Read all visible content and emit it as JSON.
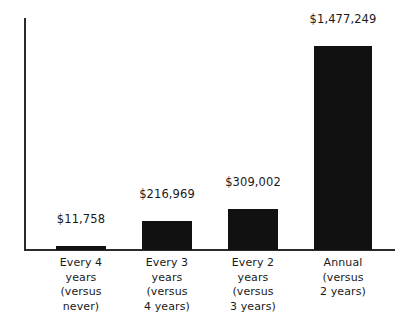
{
  "chart_data": {
    "type": "bar",
    "title": "",
    "subtitle": "",
    "xlabel": "",
    "ylabel": "",
    "grid": false,
    "legend": false,
    "axis_color": "#2b2b2b",
    "bar_color": "#111111",
    "background": "#ffffff",
    "ylim": [
      0,
      1680000
    ],
    "categories": [
      "Every 4 years (versus never)",
      "Every 3 years (versus 4 years)",
      "Every 2 years (versus 3 years)",
      "Annual (versus 2 years)"
    ],
    "category_lines": [
      [
        "Every 4 years",
        "(versus",
        "never)"
      ],
      [
        "Every 3 years",
        "(versus",
        "4 years)"
      ],
      [
        "Every 2 years",
        "(versus",
        "3 years)"
      ],
      [
        "Annual",
        "(versus",
        "2 years)"
      ]
    ],
    "values": [
      11758,
      216969,
      309002,
      1477249
    ],
    "value_labels": [
      "$11,758",
      "$216,969",
      "$309,002",
      "$1,477,249"
    ],
    "bars": [
      {
        "name": "every-4-years",
        "value": 11758,
        "value_label": "$11,758",
        "label_lines": [
          "Every 4 years",
          "(versus",
          "never)"
        ],
        "left_px": 30,
        "width_px": 50,
        "height_px": 4,
        "value_top_px": 194
      },
      {
        "name": "every-3-years",
        "value": 216969,
        "value_label": "$216,969",
        "label_lines": [
          "Every 3 years",
          "(versus",
          "4 years)"
        ],
        "left_px": 116,
        "width_px": 50,
        "height_px": 29,
        "value_top_px": 169
      },
      {
        "name": "every-2-years",
        "value": 309002,
        "value_label": "$309,002",
        "label_lines": [
          "Every 2 years",
          "(versus",
          "3 years)"
        ],
        "left_px": 202,
        "width_px": 50,
        "height_px": 41,
        "value_top_px": 157
      },
      {
        "name": "annual",
        "value": 1477249,
        "value_label": "$1,477,249",
        "label_lines": [
          "Annual",
          "(versus",
          "2 years)"
        ],
        "left_px": 288,
        "width_px": 58,
        "height_px": 204,
        "value_top_px": -6
      }
    ]
  }
}
